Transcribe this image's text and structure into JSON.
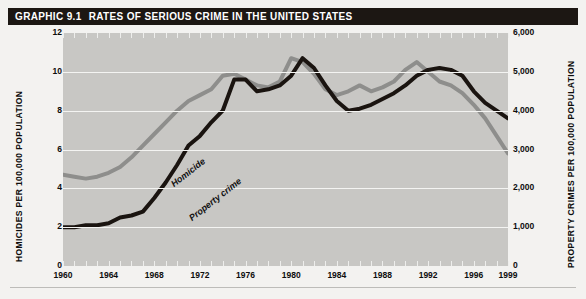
{
  "header": {
    "graphic_number": "GRAPHIC 9.1",
    "title": "RATES OF SERIOUS CRIME IN THE UNITED STATES",
    "bar_color": "#1c1713",
    "text_color": "#ffffff"
  },
  "axes": {
    "y_left_title": "HOMICIDES PER 100,000 POPULATION",
    "y_right_title": "PROPERTY CRIMES PER 100,000 POPULATION",
    "y_left_ticks": [
      "0",
      "2",
      "4",
      "6",
      "8",
      "10",
      "12"
    ],
    "y_right_ticks": [
      "0",
      "1,000",
      "2,000",
      "3,000",
      "4,000",
      "5,000",
      "6,000"
    ],
    "x_ticks": [
      "1960",
      "1964",
      "1968",
      "1972",
      "1976",
      "1980",
      "1984",
      "1988",
      "1992",
      "1996",
      "1999"
    ]
  },
  "series_labels": {
    "homicide": "Homicide",
    "property_crime": "Property crime"
  },
  "colors": {
    "plot_background": "#c8c7c4",
    "gridline": "#f4f4f2",
    "homicide_line": "#1a1410",
    "property_line": "#8e8e8c",
    "page_background": "#f3f2f0"
  },
  "chart_data": {
    "type": "line",
    "title": "RATES OF SERIOUS CRIME IN THE UNITED STATES",
    "xlabel": "",
    "ylabel": "HOMICIDES PER 100,000 POPULATION",
    "y2label": "PROPERTY CRIMES PER 100,000 POPULATION",
    "xlim": [
      1960,
      1999
    ],
    "ylim": [
      0,
      12
    ],
    "y2lim": [
      0,
      6000
    ],
    "grid": true,
    "legend": "inline-labels",
    "x": [
      1960,
      1961,
      1962,
      1963,
      1964,
      1965,
      1966,
      1967,
      1968,
      1969,
      1970,
      1971,
      1972,
      1973,
      1974,
      1975,
      1976,
      1977,
      1978,
      1979,
      1980,
      1981,
      1982,
      1983,
      1984,
      1985,
      1986,
      1987,
      1988,
      1989,
      1990,
      1991,
      1992,
      1993,
      1994,
      1995,
      1996,
      1997,
      1998,
      1999
    ],
    "series": [
      {
        "name": "Homicide",
        "axis": "left",
        "color": "#1a1410",
        "units": "per 100,000 population",
        "values": [
          2.0,
          2.0,
          2.1,
          2.1,
          2.2,
          2.5,
          2.6,
          2.8,
          3.5,
          4.3,
          5.2,
          6.2,
          6.7,
          7.4,
          8.0,
          9.6,
          9.6,
          9.0,
          9.1,
          9.3,
          9.8,
          10.7,
          10.2,
          9.3,
          8.5,
          8.0,
          8.1,
          8.3,
          8.6,
          8.9,
          9.3,
          9.8,
          10.1,
          10.2,
          10.1,
          9.8,
          9.0,
          8.4,
          8.0,
          7.6
        ]
      },
      {
        "name": "Property crime",
        "axis": "right",
        "color": "#8e8e8c",
        "units": "per 100,000 population",
        "values": [
          2350,
          2300,
          2250,
          2300,
          2400,
          2550,
          2800,
          3100,
          3400,
          3700,
          4000,
          4250,
          4400,
          4550,
          4900,
          4950,
          4800,
          4650,
          4600,
          4750,
          5350,
          5250,
          4950,
          4550,
          4400,
          4500,
          4650,
          4500,
          4600,
          4750,
          5050,
          5250,
          5000,
          4750,
          4650,
          4450,
          4150,
          3800,
          3350,
          2900
        ]
      }
    ]
  }
}
